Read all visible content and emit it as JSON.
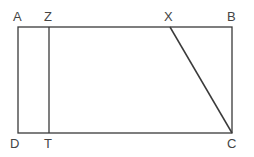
{
  "diagram": {
    "stroke_color": "#3a3a3a",
    "label_color": "#444444",
    "points": {
      "A": {
        "label": "A",
        "x": 18,
        "y": 27
      },
      "Z": {
        "label": "Z",
        "x": 49,
        "y": 27
      },
      "X": {
        "label": "X",
        "x": 170,
        "y": 27
      },
      "B": {
        "label": "B",
        "x": 232,
        "y": 27
      },
      "D": {
        "label": "D",
        "x": 18,
        "y": 133
      },
      "T": {
        "label": "T",
        "x": 49,
        "y": 133
      },
      "C": {
        "label": "C",
        "x": 232,
        "y": 133
      }
    },
    "segments": [
      "AB",
      "BC",
      "CD",
      "DA",
      "ZT",
      "XC"
    ]
  }
}
